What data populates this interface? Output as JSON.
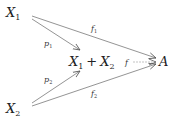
{
  "nodes": {
    "x1": {
      "label": "X",
      "sub": "1"
    },
    "x2": {
      "label": "X",
      "sub": "2"
    },
    "sum": {
      "a": "X",
      "a_sub": "1",
      "plus": "+",
      "b": "X",
      "b_sub": "2"
    },
    "a": {
      "label": "A"
    }
  },
  "arrows": {
    "p1": {
      "label": "p",
      "sub": "1"
    },
    "p2": {
      "label": "p",
      "sub": "2"
    },
    "f1": {
      "label": "f",
      "sub": "1"
    },
    "f2": {
      "label": "f",
      "sub": "2"
    },
    "f": {
      "label": "f",
      "style": "dashed"
    }
  }
}
